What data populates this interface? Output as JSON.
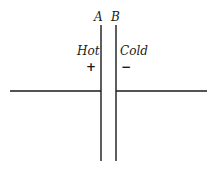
{
  "diagram": {
    "plates": [
      {
        "label": "A",
        "side_label": "Hot",
        "sign": "+"
      },
      {
        "label": "B",
        "side_label": "Cold",
        "sign": "−"
      }
    ]
  }
}
